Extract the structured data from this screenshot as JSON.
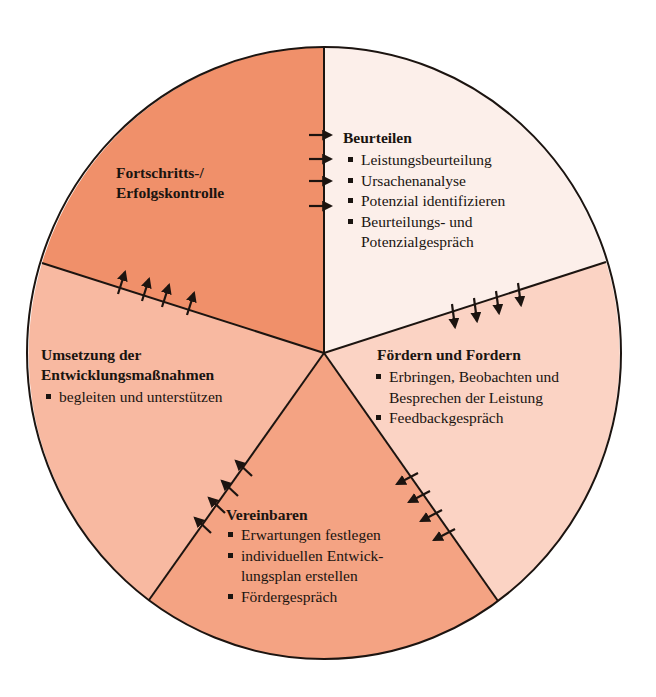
{
  "diagram": {
    "type": "cycle-wheel",
    "colors": {
      "outline": "#1c1410",
      "segment_fortschritt": "#f0906a",
      "segment_beurteilen": "#fcefea",
      "segment_foerdern": "#fbd3c4",
      "segment_vereinbaren": "#f4a383",
      "segment_umsetzung": "#f8b9a1"
    },
    "segments": [
      {
        "id": "fortschritt",
        "title_lines": [
          "Fortschritts-/",
          "Erfolgskontrolle"
        ],
        "items": []
      },
      {
        "id": "beurteilen",
        "title": "Beurteilen",
        "items": [
          {
            "lines": [
              "Leistungsbeurteilung"
            ]
          },
          {
            "lines": [
              "Ursachenanalyse"
            ]
          },
          {
            "lines": [
              "Potenzial identifizieren"
            ]
          },
          {
            "lines": [
              "Beurteilungs- und",
              "Potenzialgespräch"
            ]
          }
        ]
      },
      {
        "id": "foerdern",
        "title": "Fördern und Fordern",
        "items": [
          {
            "lines": [
              "Erbringen, Beobachten und",
              "Besprechen der Leistung"
            ]
          },
          {
            "lines": [
              "Feedbackgespräch"
            ]
          }
        ]
      },
      {
        "id": "vereinbaren",
        "title": "Vereinbaren",
        "items": [
          {
            "lines": [
              "Erwartungen festlegen"
            ]
          },
          {
            "lines": [
              "individuellen Entwick-",
              "lungsplan erstellen"
            ]
          },
          {
            "lines": [
              "Fördergespräch"
            ]
          }
        ]
      },
      {
        "id": "umsetzung",
        "title_lines": [
          "Umsetzung der",
          "Entwicklungsmaßnahmen"
        ],
        "items": [
          {
            "lines": [
              "begleiten und unterstützen"
            ]
          }
        ]
      }
    ],
    "arrows": {
      "count_per_boundary": 4,
      "direction": "clockwise",
      "icon": "arrow-icon"
    }
  }
}
